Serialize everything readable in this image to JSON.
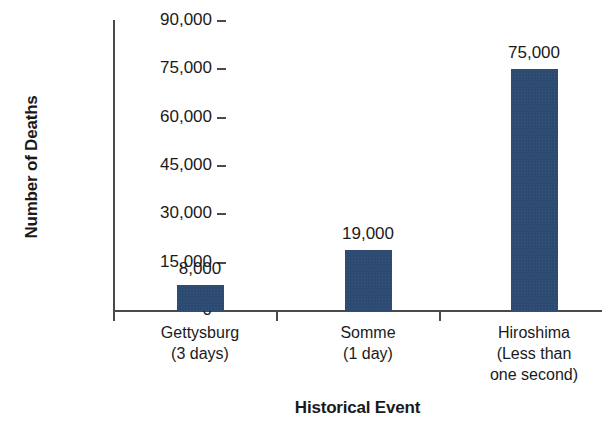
{
  "chart_data": {
    "type": "bar",
    "title": "",
    "xlabel": "Historical Event",
    "ylabel": "Number of Deaths",
    "categories": [
      "Gettysburg\n(3 days)",
      "Somme\n(1 day)",
      "Hiroshima\n(Less than\none second)"
    ],
    "category_lines": [
      [
        "Gettysburg",
        "(3 days)"
      ],
      [
        "Somme",
        "(1 day)"
      ],
      [
        "Hiroshima",
        "(Less than",
        "one second)"
      ]
    ],
    "values": [
      8000,
      19000,
      75000
    ],
    "value_labels": [
      "8,000",
      "19,000",
      "75,000"
    ],
    "ylim": [
      0,
      90000
    ],
    "ytick_values": [
      0,
      15000,
      30000,
      45000,
      60000,
      75000,
      90000
    ],
    "ytick_labels": [
      "0",
      "15,000",
      "30,000",
      "45,000",
      "60,000",
      "75,000",
      "90,000"
    ],
    "grid": false,
    "legend": false,
    "bar_color": "#2c4a72",
    "axis_color": "#4a4a4a",
    "background_color": "#ffffff"
  }
}
